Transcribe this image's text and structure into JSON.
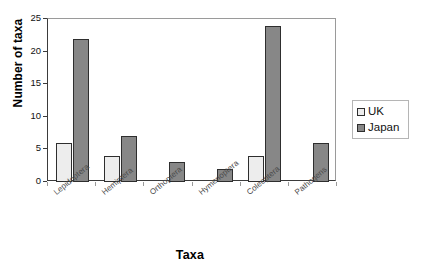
{
  "chart_data": {
    "type": "bar",
    "title": "",
    "xlabel": "Taxa",
    "ylabel": "Number of taxa",
    "ylim": [
      0,
      25
    ],
    "yticks": [
      0,
      5,
      10,
      15,
      20,
      25
    ],
    "grid": false,
    "legend_position": "right",
    "categories": [
      "Lepidoptera",
      "Hemiptera",
      "Orthoptera",
      "Hymenoptera",
      "Coleoptera",
      "Pathogens"
    ],
    "series": [
      {
        "name": "UK",
        "color": "#ededed",
        "values": [
          6,
          4,
          0,
          0,
          4,
          0
        ]
      },
      {
        "name": "Japan",
        "color": "#878787",
        "values": [
          22,
          7,
          3,
          2,
          24,
          6
        ]
      }
    ]
  },
  "legend": {
    "items": [
      {
        "label": "UK",
        "swatch": "uk"
      },
      {
        "label": "Japan",
        "swatch": "japan"
      }
    ]
  },
  "axes": {
    "y_title": "Number of taxa",
    "x_title": "Taxa"
  },
  "title_remnant": "·"
}
